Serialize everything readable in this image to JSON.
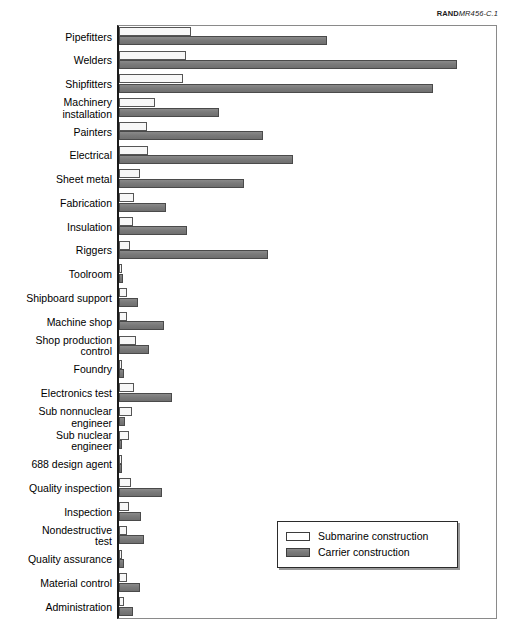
{
  "source": {
    "mark": "RAND",
    "id": "MR456-C.1"
  },
  "legend": {
    "position": "bottom-right",
    "items": [
      {
        "label": "Submarine construction",
        "swatch": "hollow-white-rect",
        "color": "#ffffff"
      },
      {
        "label": "Carrier construction",
        "swatch": "filled-gray-rect",
        "color": "#7a7a7a"
      }
    ]
  },
  "chart_data": {
    "type": "bar",
    "orientation": "horizontal",
    "title": "",
    "subtitle": "",
    "xlabel": "",
    "ylabel": "",
    "grid": false,
    "xlim": [
      0,
      100
    ],
    "axis_labels_visible": false,
    "categories": [
      "Pipefitters",
      "Welders",
      "Shipfitters",
      "Machinery\ninstallation",
      "Painters",
      "Electrical",
      "Sheet metal",
      "Fabrication",
      "Insulation",
      "Riggers",
      "Toolroom",
      "Shipboard support",
      "Machine shop",
      "Shop production\ncontrol",
      "Foundry",
      "Electronics test",
      "Sub nonnuclear\nengineer",
      "Sub nuclear\nengineer",
      "688 design agent",
      "Quality inspection",
      "Inspection",
      "Nondestructive\ntest",
      "Quality assurance",
      "Material control",
      "Administration"
    ],
    "series": [
      {
        "name": "Submarine construction",
        "color": "#ffffff",
        "values": [
          19.0,
          17.7,
          17.0,
          9.5,
          7.5,
          7.6,
          5.5,
          3.9,
          3.8,
          2.9,
          0.8,
          2.0,
          2.0,
          4.5,
          0.7,
          4.0,
          3.5,
          2.6,
          0.5,
          3.2,
          2.6,
          2.0,
          0.6,
          2.2,
          1.4
        ]
      },
      {
        "name": "Carrier construction",
        "color": "#7a7a7a",
        "values": [
          55.0,
          89.4,
          83.0,
          26.5,
          38.0,
          46.0,
          33.0,
          12.5,
          18.0,
          39.5,
          1.0,
          5.0,
          12.0,
          8.0,
          1.2,
          14.0,
          1.6,
          0.5,
          0.6,
          11.5,
          5.8,
          6.5,
          1.4,
          5.5,
          3.8
        ]
      }
    ]
  }
}
